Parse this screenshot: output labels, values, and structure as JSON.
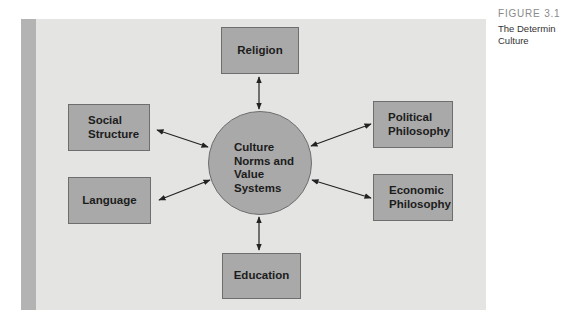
{
  "figure": {
    "number": "FIGURE 3.1",
    "caption": "The Determin\nCulture"
  },
  "diagram": {
    "center": {
      "label": "Culture\nNorms and\nValue\nSystems"
    },
    "nodes": [
      {
        "id": "religion",
        "label": "Religion",
        "position": "top"
      },
      {
        "id": "social-structure",
        "label": "Social\nStructure",
        "position": "upper-left"
      },
      {
        "id": "language",
        "label": "Language",
        "position": "lower-left"
      },
      {
        "id": "political-philosophy",
        "label": "Political\nPhilosophy",
        "position": "upper-right"
      },
      {
        "id": "economic-philosophy",
        "label": "Economic\nPhilosophy",
        "position": "lower-right"
      },
      {
        "id": "education",
        "label": "Education",
        "position": "bottom"
      }
    ],
    "edges": [
      {
        "from": "religion",
        "to": "center",
        "type": "bidirectional"
      },
      {
        "from": "social-structure",
        "to": "center",
        "type": "bidirectional"
      },
      {
        "from": "language",
        "to": "center",
        "type": "bidirectional"
      },
      {
        "from": "political-philosophy",
        "to": "center",
        "type": "bidirectional"
      },
      {
        "from": "economic-philosophy",
        "to": "center",
        "type": "bidirectional"
      },
      {
        "from": "education",
        "to": "center",
        "type": "bidirectional"
      }
    ]
  },
  "colors": {
    "panel": "#e4e4e3",
    "strip": "#b3b3b3",
    "node_fill": "#a9a9a9",
    "node_border": "#6e6e6e",
    "text": "#1c1c1c",
    "arrow": "#222222"
  }
}
